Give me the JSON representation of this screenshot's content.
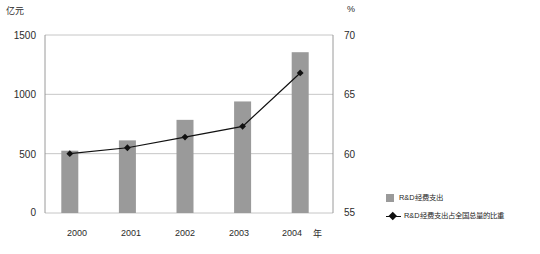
{
  "chart_data": {
    "type": "bar",
    "title": "",
    "subtitle": "",
    "categories": [
      "2000",
      "2001",
      "2002",
      "2003",
      "2004"
    ],
    "xlabel": "年",
    "grid": true,
    "legend_position": "right",
    "series": [
      {
        "name": "R&D经费支出",
        "type": "bar",
        "axis": "left",
        "unit": "亿元",
        "color": "#9a9a9a",
        "values": [
          525,
          612,
          785,
          940,
          1355
        ]
      },
      {
        "name": "R&D经费支出占全国总量的比重",
        "type": "line",
        "axis": "right",
        "unit": "%",
        "color": "#111111",
        "marker": "diamond",
        "values": [
          60.0,
          60.5,
          61.4,
          62.3,
          66.8
        ]
      }
    ],
    "left_axis": {
      "label": "亿元",
      "ylim": [
        0,
        1500
      ],
      "ticks": [
        "0",
        "500",
        "1000",
        "1500"
      ],
      "tick_values": [
        0,
        500,
        1000,
        1500
      ]
    },
    "right_axis": {
      "label": "%",
      "ylim": [
        55,
        70
      ],
      "ticks": [
        "55",
        "60",
        "65",
        "70"
      ],
      "tick_values": [
        55,
        60,
        65,
        70
      ]
    }
  },
  "axes": {
    "left_unit": "亿元",
    "right_unit": "%",
    "x_unit": "年"
  },
  "legend": {
    "items": [
      {
        "label": "R&D经费支出",
        "marker": "square-swatch"
      },
      {
        "label": "R&D经费支出占全国总量的比重",
        "marker": "diamond-line"
      }
    ]
  },
  "colors": {
    "bar": "#9a9a9a",
    "line": "#111111",
    "grid": "#b8b8b8",
    "frame": "#8f8f8f",
    "text": "#1e1e1e"
  }
}
